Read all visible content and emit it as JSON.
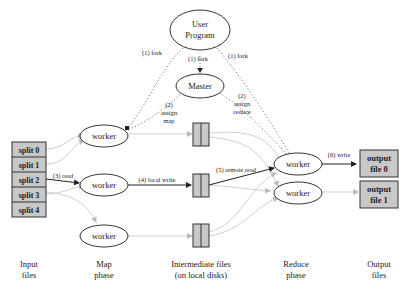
{
  "nodes": {
    "user_program": {
      "line1": "User",
      "line2": "Program"
    },
    "master": {
      "label": "Master"
    },
    "map_workers": [
      "worker",
      "worker",
      "worker"
    ],
    "reduce_workers": [
      "worker",
      "worker"
    ],
    "splits": [
      "split 0",
      "split 1",
      "split 2",
      "split 3",
      "split 4"
    ],
    "outputs": [
      {
        "line1": "output",
        "line2": "file 0"
      },
      {
        "line1": "output",
        "line2": "file 1"
      }
    ]
  },
  "edges": {
    "fork_left": "(1) fork",
    "fork_center": "(1) fork",
    "fork_right": "(1) fork",
    "assign_map": {
      "line1": "(2)",
      "line2": "assign",
      "line3": "map"
    },
    "assign_reduce": {
      "line1": "(2)",
      "line2": "assign",
      "line3": "reduce"
    },
    "read": "(3) read",
    "local_write": "(4) local write",
    "remote_read": "(5) remote read",
    "write": "(6) write"
  },
  "phases": {
    "input": {
      "line1": "Input",
      "line2": "files"
    },
    "map": {
      "line1": "Map",
      "line2": "phase"
    },
    "intermediate": {
      "line1": "Intermediate files",
      "line2": "(on local disks)"
    },
    "reduce": {
      "line1": "Reduce",
      "line2": "phase"
    },
    "output": {
      "line1": "Output",
      "line2": "files"
    }
  },
  "colors": {
    "box_fill": "#c8c8c8",
    "stroke": "#333333",
    "faint_edge": "#c8c8c8",
    "dotted_edge": "#666666"
  }
}
